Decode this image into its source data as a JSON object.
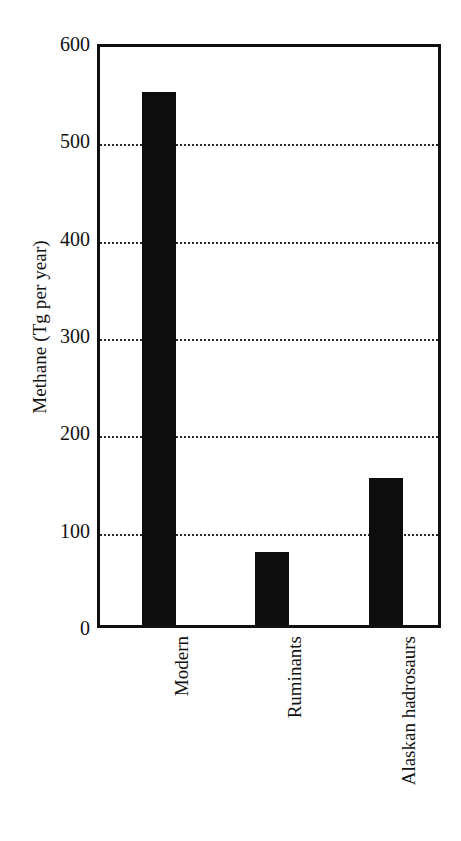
{
  "chart_data": {
    "type": "bar",
    "title": "",
    "subtitle": "",
    "xlabel": "",
    "ylabel": "Methane (Tg per year)",
    "categories": [
      "Modern",
      "Ruminants",
      "Alaskan hadrosaurs"
    ],
    "values": [
      548,
      75,
      151
    ],
    "series": [
      {
        "name": "Methane emission",
        "values": [
          548,
          75,
          151
        ]
      }
    ],
    "ylim": [
      0,
      600
    ],
    "ytick_labels": [
      "0",
      "100",
      "200",
      "300",
      "400",
      "500",
      "600"
    ],
    "ytick_values": [
      0,
      100,
      200,
      300,
      400,
      500,
      600
    ],
    "grid": true,
    "grid_axis": "y",
    "grid_style": "dotted",
    "legend": false,
    "legend_position": "none",
    "bar_color": "#0d0d0d",
    "frame_color": "#101010",
    "gridline_color": "#2b2b2b",
    "background_color": "#ffffff",
    "xtick_rotation": 90
  },
  "figure": {
    "y_axis_title": "Methane (Tg per year)"
  }
}
